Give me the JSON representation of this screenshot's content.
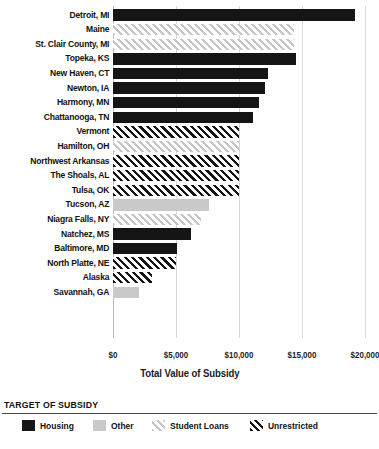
{
  "chart_data": {
    "type": "bar",
    "orientation": "horizontal",
    "title": "",
    "xlabel": "Total Value of Subsidy",
    "ylabel": "",
    "xlim": [
      0,
      20000
    ],
    "xticks": [
      0,
      5000,
      10000,
      15000,
      20000
    ],
    "xticklabels": [
      "$0",
      "$5,000",
      "$10,000",
      "$15,000",
      "$20,000"
    ],
    "grid": "vertical",
    "legend_position": "bottom",
    "legend_title": "TARGET OF SUBSIDY",
    "legend": [
      {
        "key": "housing",
        "label": "Housing",
        "color": "#151515",
        "pattern": "solid"
      },
      {
        "key": "other",
        "label": "Other",
        "color": "#c9c9c9",
        "pattern": "solid"
      },
      {
        "key": "student",
        "label": "Student Loans",
        "color": "#c6c6c6",
        "pattern": "diagonal-hatch"
      },
      {
        "key": "unrestricted",
        "label": "Unrestricted",
        "color": "#141414",
        "pattern": "diagonal-hatch"
      }
    ],
    "categories": [
      "Detroit, MI",
      "Maine",
      "St. Clair County, MI",
      "Topeka, KS",
      "New Haven, CT",
      "Newton, IA",
      "Harmony, MN",
      "Chattanooga, TN",
      "Vermont",
      "Hamilton, OH",
      "Northwest Arkansas",
      "The Shoals, AL",
      "Tulsa, OK",
      "Tucson, AZ",
      "Niagra Falls, NY",
      "Natchez, MS",
      "Baltimore, MD",
      "North Platte, NE",
      "Alaska",
      "Savannah, GA"
    ],
    "values": [
      19200,
      14400,
      14400,
      14500,
      12300,
      12100,
      11600,
      11100,
      10000,
      10000,
      10000,
      10000,
      10000,
      7600,
      7000,
      6200,
      5100,
      5000,
      3100,
      2100
    ],
    "value_labels": [
      "$19,200",
      "$14,400",
      "$14,400",
      "$14,500",
      "$12,300",
      "$12,100",
      "$11,600",
      "$11,100",
      "$10,000",
      "$10,000",
      "$10,000",
      "$10,000",
      "$10,000",
      "$7,600",
      "$7,000",
      "$6,200",
      "$5,100",
      "$5,000",
      "$3,100",
      "$2,100"
    ],
    "series_keys": [
      "housing",
      "student",
      "student",
      "housing",
      "housing",
      "housing",
      "housing",
      "housing",
      "unrestricted",
      "student",
      "unrestricted",
      "unrestricted",
      "unrestricted",
      "other",
      "student",
      "housing",
      "housing",
      "unrestricted",
      "unrestricted",
      "other"
    ]
  }
}
